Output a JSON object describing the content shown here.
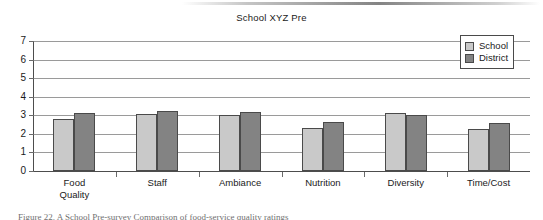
{
  "chart_data": {
    "type": "bar",
    "title": "School XYZ Pre",
    "xlabel": "",
    "ylabel": "",
    "ylim": [
      0,
      7
    ],
    "yticks": [
      "0",
      "1",
      "2",
      "3",
      "4",
      "5",
      "6",
      "7"
    ],
    "grid": "horizontal",
    "legend_position": "top-right",
    "categories": [
      "Food\nQuality",
      "Staff",
      "Ambiance",
      "Nutrition",
      "Diversity",
      "Time/Cost"
    ],
    "series": [
      {
        "name": "School",
        "color": "#c9c9c9",
        "values": [
          2.8,
          3.05,
          3.0,
          2.3,
          3.15,
          2.25
        ]
      },
      {
        "name": "District",
        "color": "#838383",
        "values": [
          3.1,
          3.25,
          3.2,
          2.65,
          3.0,
          2.6
        ]
      }
    ]
  },
  "legend": {
    "entries": [
      {
        "label": "School"
      },
      {
        "label": "District"
      }
    ]
  },
  "caption": {
    "text": "Figure 22. A School Pre-survey Comparison of food-service quality ratings"
  }
}
